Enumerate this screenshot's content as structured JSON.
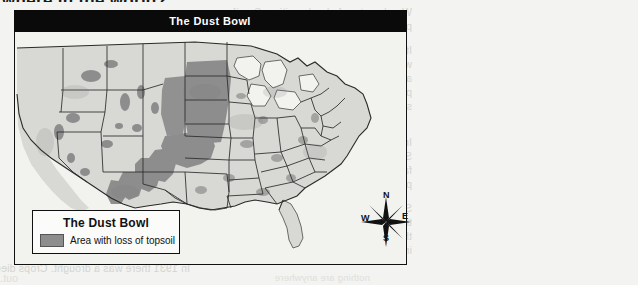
{
  "page": {
    "cut_off_heading": "where in the world?",
    "background_color": "#f3f3f1"
  },
  "map": {
    "title": "The Dust Bowl",
    "title_bar_color": "#0a0a0a",
    "title_text_color": "#ffffff",
    "border_color": "#111111",
    "land_fill": "#d8d8d4",
    "shaded_fill": "#8d8d8d",
    "water_fill": "#f2f2ef",
    "legend": {
      "title": "The Dust Bowl",
      "swatch_color": "#8d8d8d",
      "entry_label": "Area with loss of topsoil"
    },
    "compass": {
      "north": "N",
      "east": "E",
      "south": "S",
      "west": "W"
    }
  },
  "ghost_text": {
    "note": "faint show-through text from the reverse side of the printed page, mirrored",
    "lines": [
      {
        "text": "Woodrow to a federal position. See if",
        "x": 412,
        "y": 6,
        "size": 10.5,
        "faint": false
      },
      {
        "text": "people jobs for women.",
        "x": 412,
        "y": 20,
        "size": 10.5,
        "faint": false
      },
      {
        "text": "It was hard for the president to trav",
        "x": 412,
        "y": 44,
        "size": 10.5,
        "faint": false
      },
      {
        "text": "wife. His wife, Eleanor, could travel",
        "x": 412,
        "y": 58,
        "size": 10.5,
        "faint": false
      },
      {
        "text": "around the country. Reporters fol",
        "x": 412,
        "y": 72,
        "size": 10.5,
        "faint": false
      },
      {
        "text": "people in the Depression. She reported",
        "x": 412,
        "y": 86,
        "size": 10.5,
        "faint": false
      },
      {
        "text": "spoke out for women and families wh",
        "x": 412,
        "y": 100,
        "size": 10.5,
        "faint": false
      },
      {
        "text": "In the 1930s, an environmental disas",
        "x": 412,
        "y": 136,
        "size": 10.5,
        "faint": false
      },
      {
        "text": "States. The disaster was caused both",
        "x": 412,
        "y": 150,
        "size": 10.5,
        "faint": false
      },
      {
        "text": "farmers on the Great Plains had plow",
        "x": 412,
        "y": 164,
        "size": 10.5,
        "faint": false
      },
      {
        "text": "plant more and more crops.",
        "x": 412,
        "y": 178,
        "size": 10.5,
        "faint": false
      },
      {
        "text": "So much plowing exposed the soil",
        "x": 412,
        "y": 202,
        "size": 10.5,
        "faint": false
      },
      {
        "text": "the Great Plains. People didn't realize",
        "x": 412,
        "y": 216,
        "size": 10.5,
        "faint": false
      },
      {
        "text": "the short prairie grass held",
        "x": 412,
        "y": 230,
        "size": 10.5,
        "faint": false
      },
      {
        "text": "in place.",
        "x": 412,
        "y": 244,
        "size": 10.5,
        "faint": false
      },
      {
        "text": "In 1931 there was a drought. Crops died and the ground dried",
        "x": 190,
        "y": 262,
        "size": 10.5,
        "faint": false
      },
      {
        "text": "out. Then the wind started blowing",
        "x": 18,
        "y": 272,
        "size": 10.5,
        "faint": true
      },
      {
        "text": "nothing are anywhere",
        "x": 370,
        "y": 272,
        "size": 9.5,
        "faint": true
      }
    ]
  }
}
